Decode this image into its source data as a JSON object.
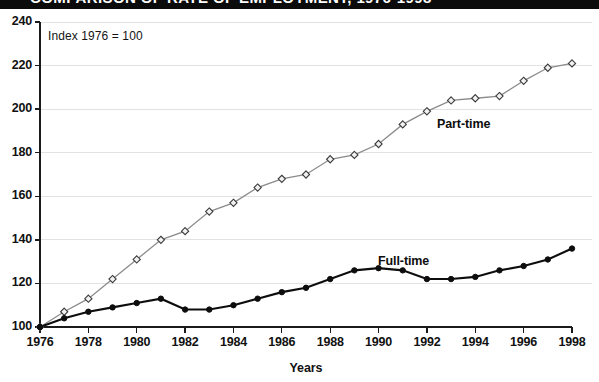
{
  "title_band": {
    "text": "COMPARISON OF RATE OF EMPLOYMENT, 1976-1998",
    "background_color": "#0b0b0b",
    "text_color": "#ffffff",
    "note": "clipped at top edge of screenshot"
  },
  "annotation": {
    "index_note": "Index 1976 = 100"
  },
  "series_labels": {
    "part_time": "Part-time",
    "full_time": "Full-time"
  },
  "colors": {
    "part_time_line": "#8b8b8b",
    "part_time_marker_fill": "#f2f2f2",
    "part_time_marker_stroke": "#3b3b3b",
    "full_time_line": "#0d0d0d",
    "full_time_marker": "#0d0d0d",
    "gridline": "#e2e2e2",
    "axis": "#1b1b1b",
    "background": "#ffffff"
  },
  "chart_data": {
    "type": "line",
    "title": "COMPARISON OF RATE OF EMPLOYMENT, 1976-1998",
    "subtitle": "Index 1976 = 100",
    "xlabel": "Years",
    "ylabel": "",
    "xlim": [
      1976,
      1998
    ],
    "ylim": [
      100,
      240
    ],
    "ytick_step": 20,
    "xtick_step": 2,
    "grid": true,
    "legend_position": "inline-annotation",
    "ytick_labels": [
      "100",
      "120",
      "140",
      "160",
      "180",
      "200",
      "220",
      "240"
    ],
    "yticks": [
      100,
      120,
      140,
      160,
      180,
      200,
      220,
      240
    ],
    "xtick_labels": [
      "1976",
      "1978",
      "1980",
      "1982",
      "1984",
      "1986",
      "1988",
      "1990",
      "1992",
      "1994",
      "1996",
      "1998"
    ],
    "xticks": [
      1976,
      1978,
      1980,
      1982,
      1984,
      1986,
      1988,
      1990,
      1992,
      1994,
      1996,
      1998
    ],
    "x": [
      1976,
      1977,
      1978,
      1979,
      1980,
      1981,
      1982,
      1983,
      1984,
      1985,
      1986,
      1987,
      1988,
      1989,
      1990,
      1991,
      1992,
      1993,
      1994,
      1995,
      1996,
      1997,
      1998
    ],
    "series": [
      {
        "name": "Part-time",
        "marker": "open-diamond",
        "color": "#8b8b8b",
        "values": [
          100,
          107,
          113,
          122,
          131,
          140,
          144,
          153,
          157,
          164,
          168,
          170,
          177,
          179,
          184,
          193,
          199,
          204,
          205,
          206,
          213,
          219,
          221
        ]
      },
      {
        "name": "Full-time",
        "marker": "filled-circle",
        "color": "#0d0d0d",
        "values": [
          100,
          104,
          107,
          109,
          111,
          113,
          108,
          108,
          110,
          113,
          116,
          118,
          122,
          126,
          127,
          126,
          122,
          122,
          123,
          126,
          128,
          131,
          136
        ]
      }
    ]
  },
  "axis_titles": {
    "x": "Years"
  }
}
